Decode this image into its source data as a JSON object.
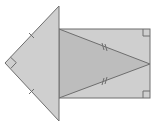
{
  "diagram": {
    "colors": {
      "background": "#ffffff",
      "fill_outer": "#cfcfcf",
      "fill_inner": "#bdbdbd",
      "stroke": "#6e6e6e"
    },
    "left_triangle": {
      "vertices": [
        [
          59,
          6
        ],
        [
          5,
          63
        ],
        [
          59,
          121
        ]
      ],
      "right_angle_at": "left vertex",
      "equal_sides_ticks": 1
    },
    "rectangle": {
      "x": 59,
      "y": 29,
      "width": 91,
      "height": 69,
      "right_angle_marks": [
        "top-right",
        "bottom-right"
      ]
    },
    "inner_triangle": {
      "vertices": [
        [
          59,
          29
        ],
        [
          150,
          64
        ],
        [
          59,
          98
        ]
      ],
      "equal_sides_ticks": 2
    }
  }
}
